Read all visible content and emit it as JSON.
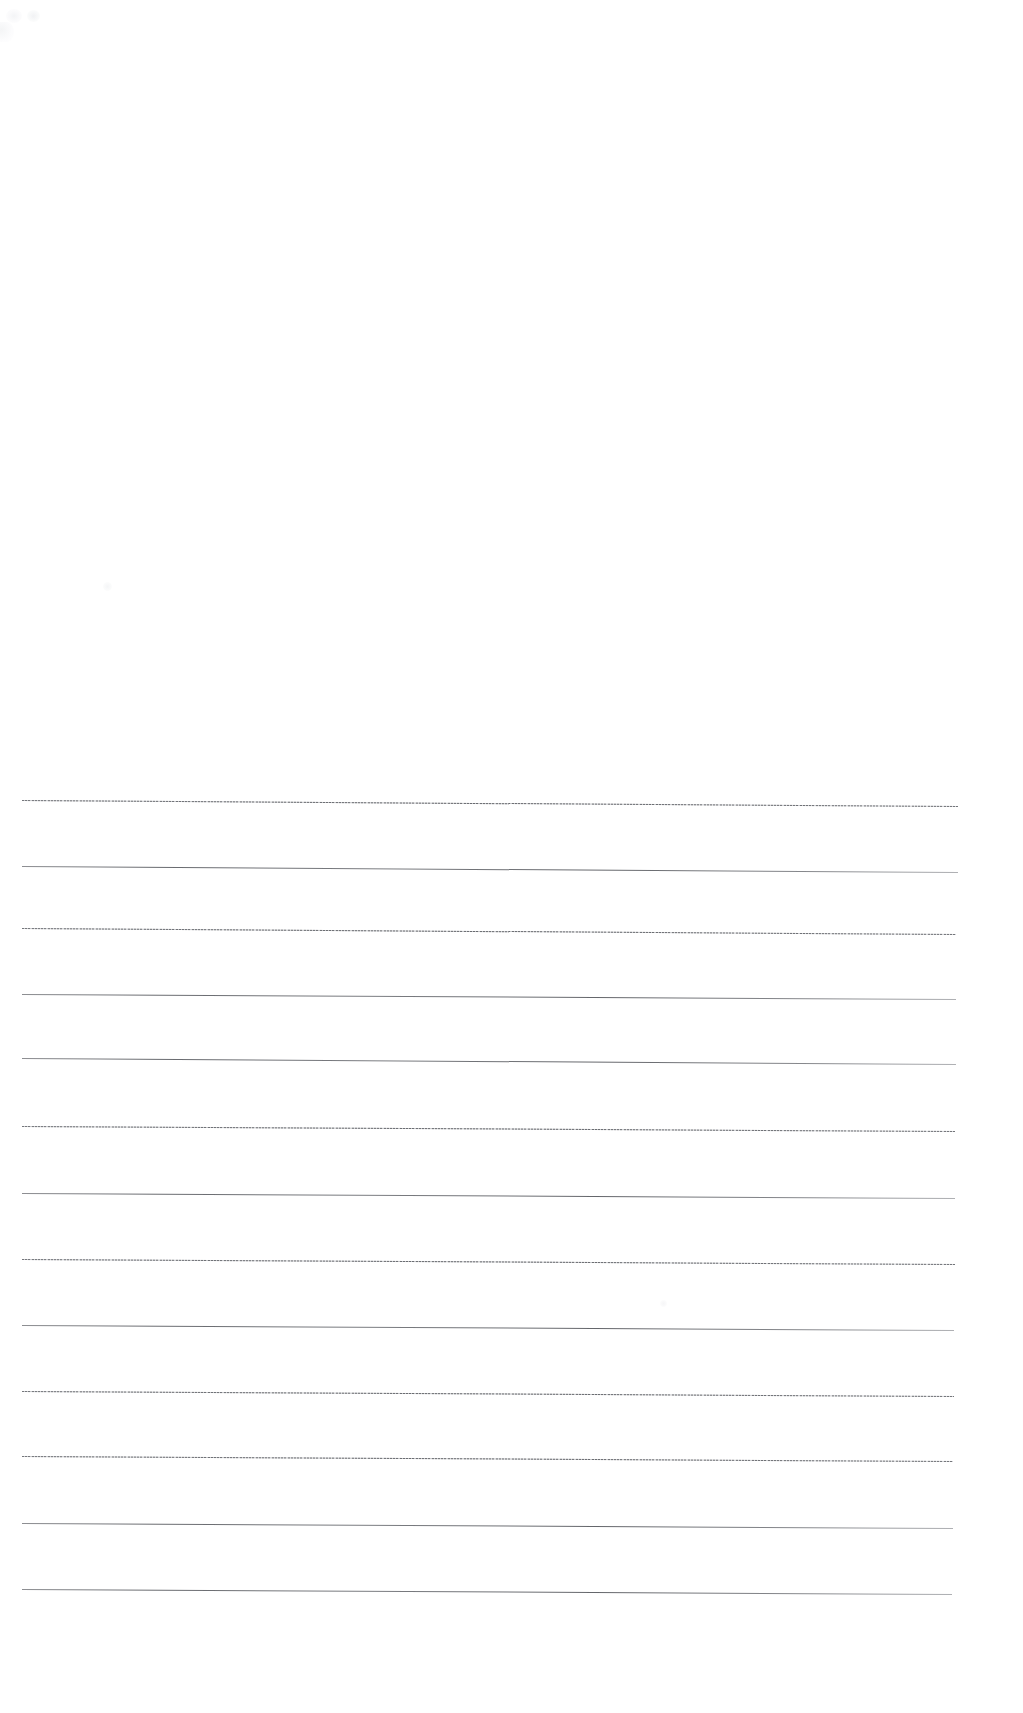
{
  "page": {
    "kind": "scanned-ruled-paper",
    "width": 1023,
    "height": 1713,
    "background_color": "#ffffff",
    "content_text": ""
  },
  "rules": {
    "count": 13,
    "line_color": "#6e7075",
    "left_x": 22,
    "right_x": 956,
    "first_y": 803,
    "spacing": 65.7,
    "slant_px": 6,
    "lines": [
      {
        "index": 1,
        "y_left": 800,
        "y_right": 806,
        "x_start": 22,
        "x_end": 958,
        "style": "dotty",
        "weight": 1
      },
      {
        "index": 2,
        "y_left": 866,
        "y_right": 872,
        "x_start": 22,
        "x_end": 958,
        "style": "solid",
        "weight": 1
      },
      {
        "index": 3,
        "y_left": 928,
        "y_right": 934,
        "x_start": 22,
        "x_end": 956,
        "style": "dotty",
        "weight": 1
      },
      {
        "index": 4,
        "y_left": 994,
        "y_right": 999,
        "x_start": 22,
        "x_end": 956,
        "style": "solid",
        "weight": 1
      },
      {
        "index": 5,
        "y_left": 1058,
        "y_right": 1064,
        "x_start": 22,
        "x_end": 956,
        "style": "solid",
        "weight": 1
      },
      {
        "index": 6,
        "y_left": 1126,
        "y_right": 1131,
        "x_start": 22,
        "x_end": 955,
        "style": "dotty",
        "weight": 1
      },
      {
        "index": 7,
        "y_left": 1193,
        "y_right": 1198,
        "x_start": 22,
        "x_end": 955,
        "style": "solid",
        "weight": 1
      },
      {
        "index": 8,
        "y_left": 1259,
        "y_right": 1264,
        "x_start": 22,
        "x_end": 955,
        "style": "dotty",
        "weight": 1
      },
      {
        "index": 9,
        "y_left": 1325,
        "y_right": 1330,
        "x_start": 22,
        "x_end": 954,
        "style": "solid",
        "weight": 1
      },
      {
        "index": 10,
        "y_left": 1391,
        "y_right": 1396,
        "x_start": 22,
        "x_end": 954,
        "style": "dotty",
        "weight": 1
      },
      {
        "index": 11,
        "y_left": 1456,
        "y_right": 1461,
        "x_start": 22,
        "x_end": 953,
        "style": "dotty",
        "weight": 1
      },
      {
        "index": 12,
        "y_left": 1523,
        "y_right": 1528,
        "x_start": 22,
        "x_end": 953,
        "style": "solid",
        "weight": 1
      },
      {
        "index": 13,
        "y_left": 1589,
        "y_right": 1594,
        "x_start": 22,
        "x_end": 952,
        "style": "solid",
        "weight": 1
      }
    ]
  },
  "artifacts": {
    "label": "scan-artifacts",
    "items": [
      {
        "name": "corner-smudge-a"
      },
      {
        "name": "corner-smudge-b"
      },
      {
        "name": "edge-smudge-c"
      },
      {
        "name": "speck-d"
      },
      {
        "name": "speck-e"
      }
    ]
  }
}
